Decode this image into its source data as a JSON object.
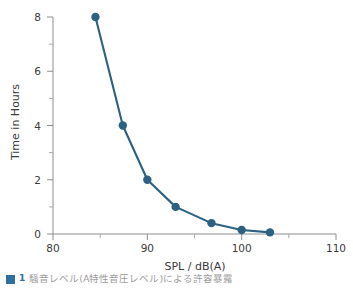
{
  "chart_data": {
    "type": "line",
    "title": "",
    "xlabel": "SPL / dB(A)",
    "ylabel": "Time in Hours",
    "xlim": [
      80,
      110
    ],
    "ylim": [
      0,
      8
    ],
    "grid": false,
    "legend": "none",
    "marker": "circle",
    "series_color": "#2c6182",
    "x": [
      84.5,
      87.4,
      90.0,
      93.0,
      96.8,
      100.0,
      103.0
    ],
    "values": [
      8.0,
      4.0,
      2.0,
      1.0,
      0.4,
      0.15,
      0.06
    ],
    "series": [
      {
        "name": "Permissible exposure time",
        "x": [
          84.5,
          87.4,
          90.0,
          93.0,
          96.8,
          100.0,
          103.0
        ],
        "values": [
          8.0,
          4.0,
          2.0,
          1.0,
          0.4,
          0.15,
          0.06
        ]
      }
    ],
    "x_ticks_major": [
      80,
      90,
      100,
      110
    ],
    "x_tick_labels": [
      "80",
      "90",
      "100",
      "110"
    ],
    "x_ticks_minor": [
      85,
      95,
      105
    ],
    "y_ticks_major": [
      0,
      2,
      4,
      6,
      8
    ],
    "y_tick_labels": [
      "0",
      "2",
      "4",
      "6",
      "8"
    ],
    "y_ticks_minor": [
      1,
      3,
      5,
      7
    ]
  },
  "caption": {
    "marker_label": "1",
    "text": "騒音レベル(A特性音圧レベル)による許容暴露"
  }
}
